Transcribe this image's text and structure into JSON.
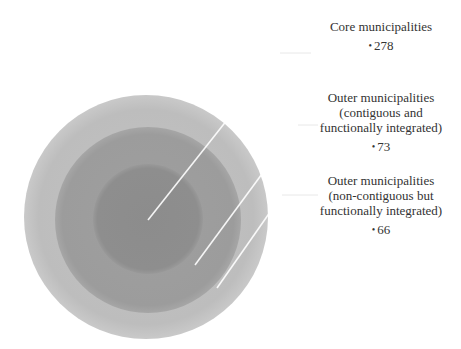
{
  "diagram": {
    "type": "nested-circles",
    "colors": {
      "outer_ring": "#bcbcbc",
      "middle_ring": "#9e9e9e",
      "inner_circle": "#8d8d8d",
      "leader_line": "#ffffff",
      "leader_line_outside": "#e6e6e6"
    },
    "items": [
      {
        "level": "inner",
        "title_lines": [
          "Core municipalities"
        ],
        "bullet": "•",
        "value": "278"
      },
      {
        "level": "middle",
        "title_lines": [
          "Outer municipalities",
          "(contiguous and",
          "functionally integrated)"
        ],
        "bullet": "•",
        "value": "73"
      },
      {
        "level": "outer",
        "title_lines": [
          "Outer municipalities",
          "(non-contiguous but",
          "functionally integrated)"
        ],
        "bullet": "•",
        "value": "66"
      }
    ]
  }
}
